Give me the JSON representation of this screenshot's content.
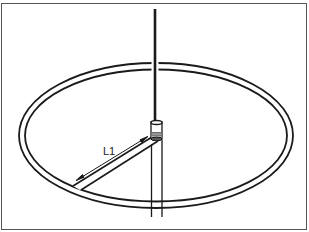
{
  "diagram": {
    "type": "antenna-illustration",
    "labels": {
      "dimension_l1": "L1"
    },
    "components": [
      {
        "name": "whip",
        "label": ""
      },
      {
        "name": "base-connector",
        "label": ""
      },
      {
        "name": "ring-ground-plane",
        "label": ""
      },
      {
        "name": "radial-strap",
        "label": ""
      },
      {
        "name": "mast",
        "label": ""
      },
      {
        "name": "dimension-arrow",
        "label": "L1"
      }
    ],
    "colors": {
      "line": "#1a1a1a",
      "frame": "#555555",
      "background": "#ffffff"
    }
  }
}
